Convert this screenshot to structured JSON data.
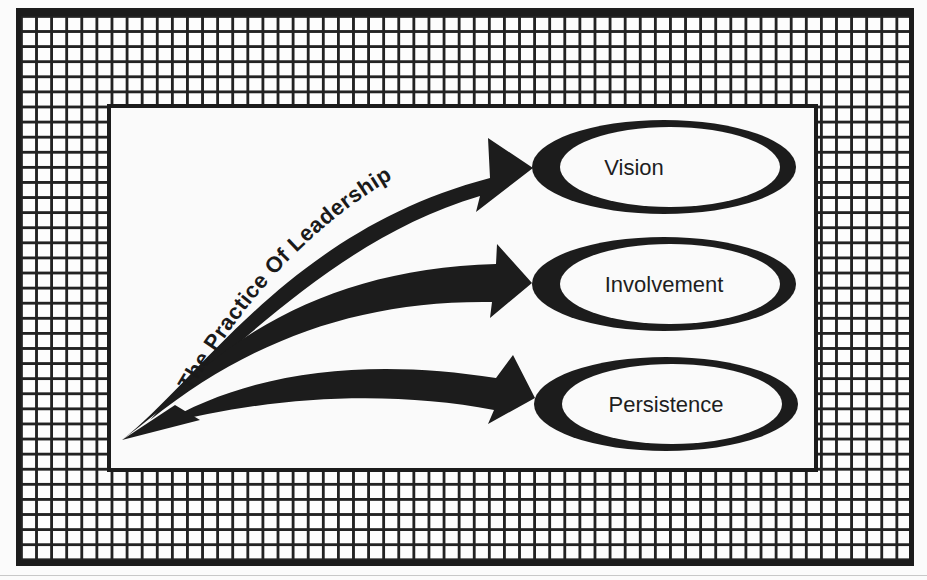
{
  "diagram": {
    "title_curve_text": "The Practice Of Leadership",
    "source_point": {
      "x": 122,
      "y": 440
    },
    "nodes": [
      {
        "id": "vision",
        "label": "Vision",
        "cx": 664,
        "cy": 167
      },
      {
        "id": "involvement",
        "label": "Involvement",
        "cx": 664,
        "cy": 284
      },
      {
        "id": "persistence",
        "label": "Persistence",
        "cx": 666,
        "cy": 404
      }
    ],
    "edges": [
      {
        "from": "origin",
        "to": "vision",
        "type": "curved-arrow"
      },
      {
        "from": "origin",
        "to": "involvement",
        "type": "curved-arrow"
      },
      {
        "from": "origin",
        "to": "persistence",
        "type": "curved-arrow"
      }
    ],
    "colors": {
      "ink": "#1c1c1c",
      "paper": "#fbfbfb"
    },
    "background_pattern": "square-grid-frame"
  }
}
